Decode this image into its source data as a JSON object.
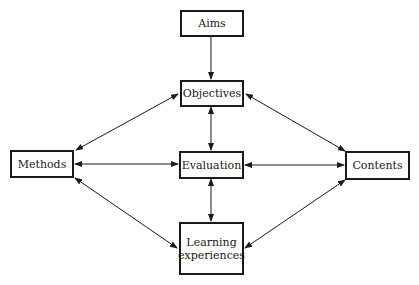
{
  "diagram": {
    "nodes": {
      "aims": {
        "label": "Aims"
      },
      "objectives": {
        "label": "Objectives"
      },
      "methods": {
        "label": "Methods"
      },
      "evaluation": {
        "label": "Evaluation"
      },
      "contents": {
        "label": "Contents"
      },
      "learning": {
        "label": "Learning experiences"
      }
    },
    "edges": [
      {
        "from": "Aims",
        "to": "Objectives",
        "direction": "one-way"
      },
      {
        "from": "Objectives",
        "to": "Evaluation",
        "direction": "both"
      },
      {
        "from": "Objectives",
        "to": "Methods",
        "direction": "both"
      },
      {
        "from": "Objectives",
        "to": "Contents",
        "direction": "both"
      },
      {
        "from": "Methods",
        "to": "Evaluation",
        "direction": "both"
      },
      {
        "from": "Evaluation",
        "to": "Contents",
        "direction": "both"
      },
      {
        "from": "Evaluation",
        "to": "Learning experiences",
        "direction": "both"
      },
      {
        "from": "Methods",
        "to": "Learning experiences",
        "direction": "both"
      },
      {
        "from": "Contents",
        "to": "Learning experiences",
        "direction": "both"
      }
    ]
  }
}
